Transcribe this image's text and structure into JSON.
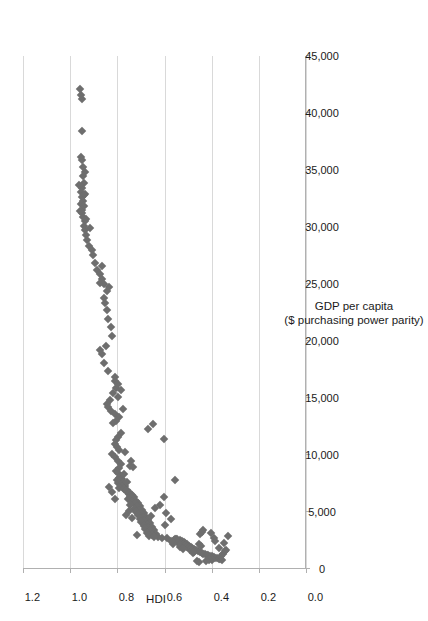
{
  "chart_data": {
    "type": "scatter",
    "title": "",
    "orientation_note": "chart rendered rotated 90 degrees counter-clockwise in the page",
    "xlabel": "GDP per capita",
    "xlabel_line2": "($ purchasing power parity)",
    "ylabel": "HDI",
    "xlim": [
      0,
      45000
    ],
    "ylim": [
      0.0,
      1.2
    ],
    "grid": "y-gridlines only",
    "legend": "none",
    "marker": {
      "shape": "diamond",
      "color": "#6e6e6e",
      "size_px": 6
    },
    "xticks": [
      0,
      5000,
      10000,
      15000,
      20000,
      25000,
      30000,
      35000,
      40000,
      45000
    ],
    "xtick_labels": [
      "0",
      "5,000",
      "10,000",
      "15,000",
      "20,000",
      "25,000",
      "30,000",
      "35,000",
      "40,000",
      "45,000"
    ],
    "yticks": [
      0.0,
      0.2,
      0.4,
      0.6,
      0.8,
      1.0,
      1.2
    ],
    "ytick_labels": [
      "0.0",
      "0.2",
      "0.4",
      "0.6",
      "0.8",
      "1.0",
      "1.2"
    ],
    "series_name": "Countries",
    "points": [
      [
        41200,
        0.949
      ],
      [
        41600,
        0.953
      ],
      [
        42100,
        0.957
      ],
      [
        38400,
        0.949
      ],
      [
        36100,
        0.955
      ],
      [
        35900,
        0.951
      ],
      [
        34500,
        0.944
      ],
      [
        33900,
        0.942
      ],
      [
        33400,
        0.949
      ],
      [
        33100,
        0.955
      ],
      [
        32800,
        0.943
      ],
      [
        32600,
        0.951
      ],
      [
        32300,
        0.947
      ],
      [
        32000,
        0.956
      ],
      [
        31800,
        0.942
      ],
      [
        31500,
        0.948
      ],
      [
        31200,
        0.951
      ],
      [
        30900,
        0.946
      ],
      [
        30500,
        0.935
      ],
      [
        30100,
        0.941
      ],
      [
        29700,
        0.938
      ],
      [
        29300,
        0.932
      ],
      [
        28900,
        0.927
      ],
      [
        28300,
        0.921
      ],
      [
        27500,
        0.905
      ],
      [
        26800,
        0.896
      ],
      [
        26200,
        0.887
      ],
      [
        25900,
        0.872
      ],
      [
        25400,
        0.863
      ],
      [
        25100,
        0.874
      ],
      [
        24400,
        0.845
      ],
      [
        23800,
        0.856
      ],
      [
        23300,
        0.851
      ],
      [
        22700,
        0.842
      ],
      [
        21900,
        0.838
      ],
      [
        21200,
        0.826
      ],
      [
        20400,
        0.822
      ],
      [
        19600,
        0.846
      ],
      [
        18900,
        0.864
      ],
      [
        18100,
        0.855
      ],
      [
        17400,
        0.841
      ],
      [
        16500,
        0.812
      ],
      [
        15900,
        0.806
      ],
      [
        15400,
        0.819
      ],
      [
        15100,
        0.798
      ],
      [
        14800,
        0.833
      ],
      [
        14500,
        0.842
      ],
      [
        14200,
        0.838
      ],
      [
        13900,
        0.826
      ],
      [
        13600,
        0.812
      ],
      [
        13300,
        0.794
      ],
      [
        13000,
        0.806
      ],
      [
        12700,
        0.648
      ],
      [
        12300,
        0.668
      ],
      [
        11900,
        0.786
      ],
      [
        11600,
        0.798
      ],
      [
        11300,
        0.804
      ],
      [
        11000,
        0.812
      ],
      [
        10700,
        0.801
      ],
      [
        10400,
        0.792
      ],
      [
        10100,
        0.822
      ],
      [
        9800,
        0.811
      ],
      [
        9500,
        0.796
      ],
      [
        9200,
        0.784
      ],
      [
        8900,
        0.793
      ],
      [
        8600,
        0.806
      ],
      [
        8400,
        0.798
      ],
      [
        8200,
        0.786
      ],
      [
        8000,
        0.795
      ],
      [
        7900,
        0.781
      ],
      [
        7800,
        0.802
      ],
      [
        7700,
        0.788
      ],
      [
        7600,
        0.774
      ],
      [
        7500,
        0.796
      ],
      [
        7400,
        0.783
      ],
      [
        7300,
        0.768
      ],
      [
        7200,
        0.779
      ],
      [
        7100,
        0.791
      ],
      [
        7000,
        0.772
      ],
      [
        6900,
        0.758
      ],
      [
        6800,
        0.765
      ],
      [
        6700,
        0.745
      ],
      [
        6600,
        0.752
      ],
      [
        6500,
        0.736
      ],
      [
        6400,
        0.748
      ],
      [
        6300,
        0.729
      ],
      [
        6200,
        0.742
      ],
      [
        6100,
        0.755
      ],
      [
        6000,
        0.722
      ],
      [
        5900,
        0.738
      ],
      [
        5800,
        0.713
      ],
      [
        5700,
        0.726
      ],
      [
        5600,
        0.747
      ],
      [
        5500,
        0.702
      ],
      [
        5400,
        0.718
      ],
      [
        5300,
        0.731
      ],
      [
        5200,
        0.694
      ],
      [
        5100,
        0.709
      ],
      [
        5000,
        0.722
      ],
      [
        4900,
        0.686
      ],
      [
        4800,
        0.701
      ],
      [
        4700,
        0.714
      ],
      [
        4600,
        0.678
      ],
      [
        4500,
        0.693
      ],
      [
        4400,
        0.706
      ],
      [
        4300,
        0.671
      ],
      [
        4200,
        0.685
      ],
      [
        4100,
        0.698
      ],
      [
        4000,
        0.662
      ],
      [
        3900,
        0.676
      ],
      [
        3800,
        0.689
      ],
      [
        3700,
        0.654
      ],
      [
        3600,
        0.668
      ],
      [
        3500,
        0.682
      ],
      [
        3400,
        0.646
      ],
      [
        3300,
        0.661
      ],
      [
        3200,
        0.674
      ],
      [
        3100,
        0.638
      ],
      [
        3000,
        0.652
      ],
      [
        2950,
        0.718
      ],
      [
        2900,
        0.667
      ],
      [
        2850,
        0.629
      ],
      [
        2800,
        0.643
      ],
      [
        2750,
        0.591
      ],
      [
        2700,
        0.612
      ],
      [
        2650,
        0.556
      ],
      [
        2600,
        0.548
      ],
      [
        2550,
        0.534
      ],
      [
        2500,
        0.561
      ],
      [
        2450,
        0.527
      ],
      [
        2400,
        0.542
      ],
      [
        2350,
        0.519
      ],
      [
        2300,
        0.536
      ],
      [
        2250,
        0.512
      ],
      [
        2200,
        0.528
      ],
      [
        2150,
        0.504
      ],
      [
        2100,
        0.521
      ],
      [
        2050,
        0.497
      ],
      [
        2000,
        0.513
      ],
      [
        1950,
        0.489
      ],
      [
        1900,
        0.506
      ],
      [
        1850,
        0.482
      ],
      [
        1800,
        0.498
      ],
      [
        1750,
        0.474
      ],
      [
        1700,
        0.491
      ],
      [
        1650,
        0.466
      ],
      [
        1600,
        0.483
      ],
      [
        1550,
        0.458
      ],
      [
        1500,
        0.475
      ],
      [
        1450,
        0.451
      ],
      [
        1400,
        0.443
      ],
      [
        1350,
        0.436
      ],
      [
        1300,
        0.428
      ],
      [
        1250,
        0.421
      ],
      [
        1200,
        0.414
      ],
      [
        1150,
        0.407
      ],
      [
        1100,
        0.399
      ],
      [
        1050,
        0.392
      ],
      [
        1000,
        0.385
      ],
      [
        950,
        0.378
      ],
      [
        900,
        0.371
      ],
      [
        850,
        0.364
      ],
      [
        800,
        0.357
      ],
      [
        780,
        0.398
      ],
      [
        760,
        0.412
      ],
      [
        740,
        0.426
      ],
      [
        3050,
        0.448
      ],
      [
        3250,
        0.441
      ],
      [
        3450,
        0.436
      ],
      [
        2150,
        0.452
      ],
      [
        2050,
        0.445
      ],
      [
        7800,
        0.556
      ],
      [
        6350,
        0.602
      ],
      [
        5650,
        0.618
      ],
      [
        4950,
        0.592
      ],
      [
        4350,
        0.574
      ],
      [
        3850,
        0.597
      ],
      [
        11400,
        0.602
      ],
      [
        5350,
        0.642
      ],
      [
        4650,
        0.658
      ],
      [
        8950,
        0.732
      ],
      [
        9450,
        0.744
      ],
      [
        10250,
        0.766
      ],
      [
        15700,
        0.783
      ],
      [
        16200,
        0.796
      ],
      [
        14050,
        0.774
      ],
      [
        12850,
        0.818
      ],
      [
        16800,
        0.808
      ],
      [
        19200,
        0.872
      ],
      [
        26600,
        0.866
      ],
      [
        25000,
        0.858
      ],
      [
        24700,
        0.836
      ],
      [
        28000,
        0.909
      ],
      [
        29900,
        0.918
      ],
      [
        30700,
        0.931
      ],
      [
        33700,
        0.962
      ],
      [
        34800,
        0.938
      ],
      [
        35300,
        0.946
      ],
      [
        31400,
        0.958
      ],
      [
        32900,
        0.939
      ],
      [
        2900,
        0.331
      ],
      [
        1560,
        0.344
      ],
      [
        1340,
        0.352
      ],
      [
        1120,
        0.361
      ],
      [
        1680,
        0.338
      ],
      [
        2250,
        0.346
      ],
      [
        1870,
        0.371
      ],
      [
        2480,
        0.384
      ],
      [
        2720,
        0.392
      ],
      [
        3120,
        0.404
      ],
      [
        620,
        0.452
      ],
      [
        680,
        0.463
      ],
      [
        1420,
        0.478
      ],
      [
        1920,
        0.533
      ],
      [
        2320,
        0.541
      ],
      [
        2620,
        0.552
      ],
      [
        2180,
        0.564
      ],
      [
        2420,
        0.572
      ],
      [
        1760,
        0.522
      ],
      [
        5050,
        0.752
      ],
      [
        4750,
        0.764
      ],
      [
        4450,
        0.738
      ],
      [
        6150,
        0.812
      ],
      [
        6750,
        0.824
      ],
      [
        7150,
        0.836
      ],
      [
        8350,
        0.771
      ],
      [
        7650,
        0.758
      ],
      [
        9050,
        0.746
      ]
    ]
  },
  "axes": {
    "x_title_line1": "GDP per capita",
    "x_title_line2": "($ purchasing power parity)",
    "y_title": "HDI"
  }
}
